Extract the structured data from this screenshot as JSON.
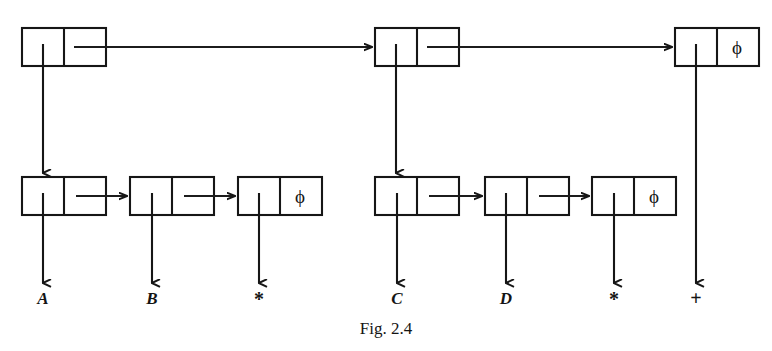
{
  "figure": {
    "caption": "Fig. 2.4",
    "caption_x": 355,
    "caption_y": 334,
    "background_color": "#ffffff",
    "ink_color": "#161616"
  },
  "geometry": {
    "cell_width": 42,
    "box_height": 38,
    "top_row_y": 28,
    "bottom_row_y": 177,
    "leaf_arrow_tip_y": 286,
    "leaf_label_y": 304
  },
  "nodes": {
    "top_row": [
      {
        "id": "top-node-1",
        "data_name": "list-node-top-1",
        "x": 22,
        "y": 28,
        "left_cell": "down-pointer",
        "right_cell": "next-pointer",
        "right_cell_text": ""
      },
      {
        "id": "top-node-2",
        "data_name": "list-node-top-2",
        "x": 375,
        "y": 28,
        "left_cell": "down-pointer",
        "right_cell": "next-pointer",
        "right_cell_text": ""
      },
      {
        "id": "top-node-3",
        "data_name": "list-node-top-3",
        "x": 675,
        "y": 28,
        "left_cell": "down-pointer",
        "right_cell": "null",
        "right_cell_text": "ϕ"
      }
    ],
    "bottom_row_left": [
      {
        "id": "bot-node-1",
        "data_name": "list-node-bottom-1",
        "x": 22,
        "y": 177,
        "left_cell": "down-pointer",
        "right_cell": "next-pointer",
        "right_cell_text": "",
        "leaf_label": "A",
        "leaf_label_kind": "identifier"
      },
      {
        "id": "bot-node-2",
        "data_name": "list-node-bottom-2",
        "x": 130,
        "y": 177,
        "left_cell": "down-pointer",
        "right_cell": "next-pointer",
        "right_cell_text": "",
        "leaf_label": "B",
        "leaf_label_kind": "identifier"
      },
      {
        "id": "bot-node-3",
        "data_name": "list-node-bottom-3",
        "x": 238,
        "y": 177,
        "left_cell": "down-pointer",
        "right_cell": "null",
        "right_cell_text": "ϕ",
        "leaf_label": "*",
        "leaf_label_kind": "operator"
      }
    ],
    "bottom_row_right": [
      {
        "id": "bot-node-4",
        "data_name": "list-node-bottom-4",
        "x": 375,
        "y": 177,
        "left_cell": "down-pointer",
        "right_cell": "next-pointer",
        "right_cell_text": "",
        "leaf_label": "C",
        "leaf_label_kind": "identifier"
      },
      {
        "id": "bot-node-5",
        "data_name": "list-node-bottom-5",
        "x": 485,
        "y": 177,
        "left_cell": "down-pointer",
        "right_cell": "next-pointer",
        "right_cell_text": "",
        "leaf_label": "D",
        "leaf_label_kind": "identifier"
      },
      {
        "id": "bot-node-6",
        "data_name": "list-node-bottom-6",
        "x": 592,
        "y": 177,
        "left_cell": "down-pointer",
        "right_cell": "null",
        "right_cell_text": "ϕ",
        "leaf_label": "*",
        "leaf_label_kind": "operator"
      }
    ]
  },
  "leaf_labels": [
    {
      "text": "A",
      "x": 43,
      "y": 304,
      "kind": "identifier"
    },
    {
      "text": "B",
      "x": 152,
      "y": 304,
      "kind": "identifier"
    },
    {
      "text": "*",
      "x": 259,
      "y": 306,
      "kind": "operator"
    },
    {
      "text": "C",
      "x": 397,
      "y": 304,
      "kind": "identifier"
    },
    {
      "text": "D",
      "x": 506,
      "y": 304,
      "kind": "identifier"
    },
    {
      "text": "*",
      "x": 614,
      "y": 306,
      "kind": "operator"
    },
    {
      "text": "+",
      "x": 696,
      "y": 305,
      "kind": "operator"
    }
  ],
  "null_markers": [
    {
      "text": "ϕ",
      "x": 737,
      "y": 54,
      "owner": "top-node-3"
    },
    {
      "text": "ϕ",
      "x": 300,
      "y": 203,
      "owner": "bot-node-3"
    },
    {
      "text": "ϕ",
      "x": 654,
      "y": 203,
      "owner": "bot-node-6"
    }
  ]
}
